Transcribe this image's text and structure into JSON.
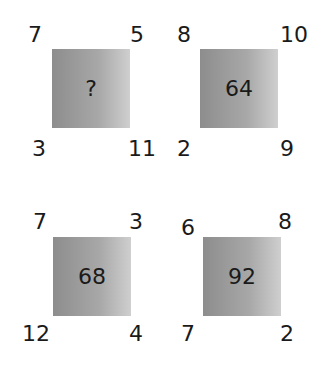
{
  "puzzles": [
    {
      "center": "?",
      "top_left": "7",
      "top_right": "5",
      "bottom_left": "3",
      "bottom_right": "11"
    },
    {
      "center": "64",
      "top_left": "8",
      "top_right": "10",
      "bottom_left": "2",
      "bottom_right": "9"
    },
    {
      "center": "68",
      "top_left": "7",
      "top_right": "3",
      "bottom_left": "12",
      "bottom_right": "4"
    },
    {
      "center": "92",
      "top_left": "6",
      "top_right": "8",
      "bottom_left": "7",
      "bottom_right": "2"
    }
  ]
}
